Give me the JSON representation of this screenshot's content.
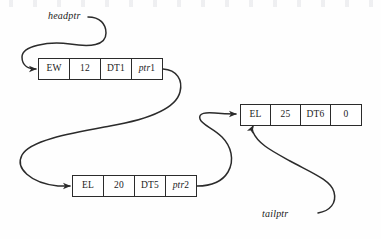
{
  "diagram": {
    "type": "singly-linked-list",
    "background_color": "#ffffff",
    "line_color": "#2b2b2b",
    "text_color": "#1a1a1a"
  },
  "pointers": [
    {
      "id": "headptr",
      "label": "headptr",
      "points_to": "node-1",
      "target_edge": "left"
    },
    {
      "id": "tailptr",
      "label": "tailptr",
      "points_to": "node-3",
      "target_edge": "bottom"
    }
  ],
  "nodes": [
    {
      "id": "node-1",
      "cells": [
        {
          "name": "type",
          "value": "EW"
        },
        {
          "name": "quantity",
          "value": "12"
        },
        {
          "name": "data",
          "value": "DT1"
        },
        {
          "name": "next",
          "value": "ptr",
          "suffix": "1",
          "italic": true
        }
      ]
    },
    {
      "id": "node-2",
      "cells": [
        {
          "name": "type",
          "value": "EL"
        },
        {
          "name": "quantity",
          "value": "20"
        },
        {
          "name": "data",
          "value": "DT5"
        },
        {
          "name": "next",
          "value": "ptr",
          "suffix": "2",
          "italic": true
        }
      ]
    },
    {
      "id": "node-3",
      "cells": [
        {
          "name": "type",
          "value": "EL"
        },
        {
          "name": "quantity",
          "value": "25"
        },
        {
          "name": "data",
          "value": "DT6"
        },
        {
          "name": "next",
          "value": "0",
          "suffix": "",
          "italic": false
        }
      ]
    }
  ],
  "links": [
    {
      "from": "headptr-label",
      "to": "node-1",
      "style": "curved-arrow"
    },
    {
      "from": "node-1.next",
      "to": "node-2",
      "style": "curved-arrow"
    },
    {
      "from": "node-2.next",
      "to": "node-3",
      "style": "curved-arrow"
    },
    {
      "from": "tailptr-label",
      "to": "node-3",
      "style": "curved-arrow"
    }
  ]
}
